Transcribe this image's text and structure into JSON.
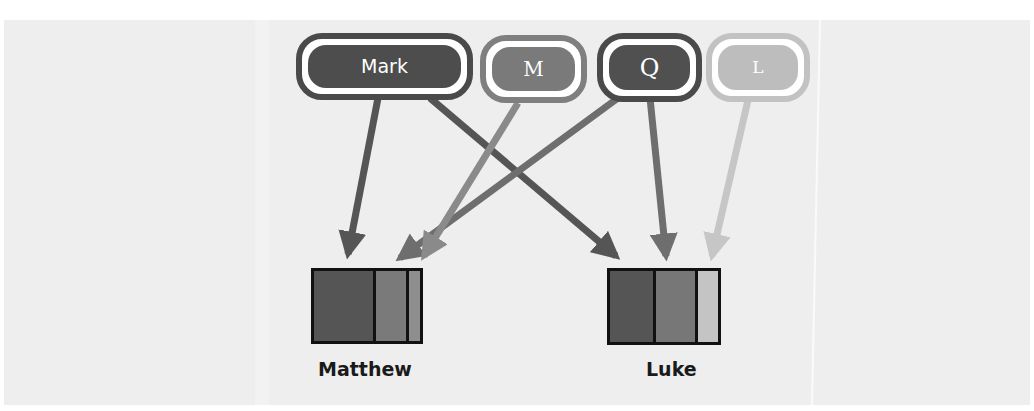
{
  "diagram": {
    "sources": [
      {
        "id": "mark",
        "label": "Mark",
        "fill": "#4d4d4d",
        "ring": "#4a4a4a",
        "font": "sans"
      },
      {
        "id": "m",
        "label": "M",
        "fill": "#7a7a7a",
        "ring": "#7f7f7f",
        "font": "serif"
      },
      {
        "id": "q",
        "label": "Q",
        "fill": "#505050",
        "ring": "#4a4a4a",
        "font": "serif"
      },
      {
        "id": "l",
        "label": "L",
        "fill": "#bdbdbd",
        "ring": "#c2c2c2",
        "font": "serif"
      }
    ],
    "targets": [
      {
        "id": "matthew",
        "label": "Matthew",
        "segments": [
          {
            "source": "mark",
            "color": "#555555",
            "width": 59
          },
          {
            "source": "q",
            "color": "#7a7a7a",
            "width": 33
          },
          {
            "source": "m",
            "color": "#8e8e8e",
            "width": 19
          }
        ]
      },
      {
        "id": "luke",
        "label": "Luke",
        "segments": [
          {
            "source": "mark",
            "color": "#555555",
            "width": 43
          },
          {
            "source": "q",
            "color": "#777777",
            "width": 42
          },
          {
            "source": "l",
            "color": "#c4c4c4",
            "width": 28
          }
        ]
      }
    ],
    "edges": [
      {
        "from": "mark",
        "to": "matthew",
        "color": "#555555"
      },
      {
        "from": "mark",
        "to": "luke",
        "color": "#555555"
      },
      {
        "from": "m",
        "to": "matthew",
        "color": "#8a8a8a"
      },
      {
        "from": "q",
        "to": "matthew",
        "color": "#6e6e6e"
      },
      {
        "from": "q",
        "to": "luke",
        "color": "#6e6e6e"
      },
      {
        "from": "l",
        "to": "luke",
        "color": "#c6c6c6"
      }
    ]
  }
}
